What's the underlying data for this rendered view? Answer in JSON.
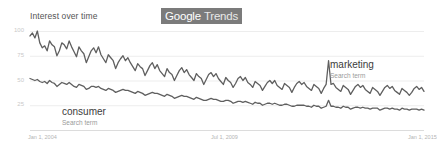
{
  "widget": {
    "title": "Interest over time",
    "brand_google": "Google",
    "brand_trends": "Trends",
    "badge_bg_color": "#7b7b7b",
    "line_color": "#5f5f5f",
    "grid_color": "#ededed"
  },
  "annotations": [
    {
      "id": "marketing",
      "name": "marketing",
      "sub": "Search term"
    },
    {
      "id": "consumer",
      "name": "consumer",
      "sub": "Search term"
    }
  ],
  "chart_data": {
    "type": "line",
    "title": "Interest over time",
    "xlabel": "",
    "ylabel": "",
    "ylim": [
      0,
      100
    ],
    "yticks": [
      100,
      75,
      50,
      25
    ],
    "ytick_labels": [
      "100",
      "75",
      "50",
      "25"
    ],
    "xticks": [
      "Jan 1, 2004",
      "Jul 1, 2009",
      "Jan 1, 2015"
    ],
    "xtick_positions": [
      0,
      0.5,
      1.0
    ],
    "grid": true,
    "grid_axis": "y",
    "legend": "inline-annotations",
    "x_start": "2004-01",
    "x_end": "2016-06",
    "x_step": "monthly",
    "series": [
      {
        "name": "marketing",
        "sublabel": "Search term",
        "color": "#5f5f5f",
        "values": [
          95,
          98,
          93,
          100,
          88,
          83,
          85,
          80,
          90,
          86,
          84,
          75,
          80,
          88,
          86,
          82,
          90,
          84,
          79,
          74,
          84,
          80,
          77,
          68,
          74,
          80,
          83,
          78,
          84,
          76,
          72,
          68,
          76,
          73,
          70,
          62,
          68,
          72,
          75,
          70,
          73,
          68,
          64,
          60,
          67,
          64,
          62,
          55,
          60,
          65,
          68,
          62,
          66,
          60,
          57,
          54,
          62,
          58,
          56,
          50,
          55,
          60,
          63,
          58,
          61,
          56,
          53,
          50,
          57,
          54,
          52,
          46,
          51,
          56,
          58,
          54,
          57,
          52,
          49,
          46,
          53,
          50,
          48,
          43,
          47,
          52,
          54,
          50,
          53,
          48,
          46,
          43,
          49,
          47,
          45,
          40,
          44,
          48,
          50,
          47,
          50,
          45,
          43,
          41,
          47,
          45,
          43,
          38,
          43,
          47,
          49,
          46,
          48,
          44,
          42,
          40,
          46,
          44,
          42,
          37,
          42,
          46,
          70,
          46,
          47,
          43,
          41,
          39,
          45,
          43,
          41,
          36,
          40,
          44,
          46,
          43,
          45,
          41,
          39,
          37,
          43,
          41,
          39,
          35,
          39,
          43,
          45,
          42,
          44,
          40,
          38,
          36,
          42,
          40,
          38,
          35,
          38,
          42,
          44,
          41,
          43,
          39
        ]
      },
      {
        "name": "consumer",
        "sublabel": "Search term",
        "color": "#5f5f5f",
        "values": [
          52,
          51,
          50,
          51,
          49,
          48,
          49,
          47,
          50,
          48,
          47,
          44,
          46,
          48,
          47,
          46,
          48,
          46,
          44,
          43,
          46,
          45,
          44,
          41,
          42,
          44,
          44,
          43,
          44,
          42,
          41,
          40,
          42,
          41,
          40,
          38,
          39,
          40,
          41,
          40,
          40,
          39,
          38,
          37,
          39,
          38,
          37,
          35,
          36,
          37,
          38,
          37,
          37,
          36,
          35,
          34,
          36,
          35,
          34,
          32,
          33,
          34,
          35,
          34,
          34,
          33,
          32,
          31,
          33,
          32,
          31,
          30,
          30,
          31,
          32,
          31,
          31,
          30,
          29,
          29,
          30,
          30,
          29,
          27,
          28,
          29,
          29,
          28,
          29,
          28,
          27,
          26,
          28,
          27,
          27,
          25,
          26,
          27,
          27,
          26,
          27,
          26,
          25,
          25,
          26,
          26,
          25,
          24,
          24,
          25,
          25,
          25,
          25,
          24,
          24,
          23,
          25,
          24,
          24,
          22,
          23,
          24,
          30,
          24,
          24,
          23,
          23,
          22,
          24,
          23,
          23,
          21,
          22,
          23,
          23,
          22,
          23,
          22,
          22,
          21,
          22,
          22,
          22,
          20,
          21,
          22,
          22,
          21,
          22,
          21,
          21,
          20,
          22,
          21,
          21,
          20,
          21,
          21,
          21,
          20,
          21,
          20
        ]
      }
    ]
  }
}
